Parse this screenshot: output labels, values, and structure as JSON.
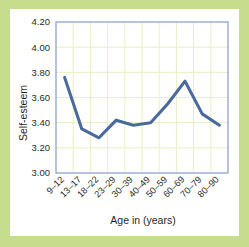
{
  "figure": {
    "frame_color": "#c6dd8e",
    "card_color": "#ffffff",
    "plot_border_color": "#7b92c4",
    "grid_color": "#e9efbe",
    "line_color": "#4a6a9e"
  },
  "chart_data": {
    "type": "line",
    "title": "",
    "xlabel": "Age in (years)",
    "ylabel": "Self-esteem",
    "categories": [
      "9–12",
      "13–17",
      "18–22",
      "23–29",
      "30–39",
      "40–49",
      "50–59",
      "60–69",
      "70–79",
      "80–90"
    ],
    "values": [
      3.76,
      3.35,
      3.28,
      3.42,
      3.38,
      3.4,
      3.55,
      3.73,
      3.47,
      3.38
    ],
    "series": [
      {
        "name": "Self-esteem",
        "values": [
          3.76,
          3.35,
          3.28,
          3.42,
          3.38,
          3.4,
          3.55,
          3.73,
          3.47,
          3.38
        ]
      }
    ],
    "ylim": [
      3.0,
      4.2
    ],
    "ytick_labels": [
      "4.20",
      "4.00",
      "3.80",
      "3.60",
      "3.40",
      "3.20",
      "3.00"
    ],
    "ytick_values": [
      4.2,
      4.0,
      3.8,
      3.6,
      3.4,
      3.2,
      3.0
    ],
    "grid": true,
    "legend": false,
    "legend_position": "none"
  }
}
